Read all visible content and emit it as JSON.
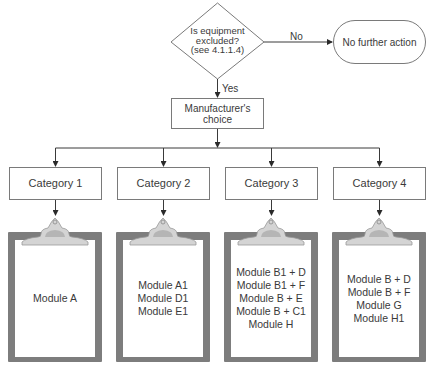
{
  "diagram": {
    "type": "flowchart",
    "decision": {
      "lines": [
        "Is equipment",
        "excluded?",
        "(see 4.1.1.4)"
      ]
    },
    "no_branch": {
      "label": "No",
      "target": "No further action"
    },
    "yes_branch": {
      "label": "Yes",
      "target": "Manufacturer's choice",
      "target_lines": [
        "Manufacturer's",
        "choice"
      ]
    },
    "categories": [
      {
        "label": "Category 1",
        "modules": [
          "Module A"
        ]
      },
      {
        "label": "Category 2",
        "modules": [
          "Module A1",
          "Module D1",
          "Module E1"
        ]
      },
      {
        "label": "Category 3",
        "modules": [
          "Module B1 + D",
          "Module B1 + F",
          "Module B + E",
          "Module B + C1",
          "Module H"
        ]
      },
      {
        "label": "Category 4",
        "modules": [
          "Module B + D",
          "Module B + F",
          "Module G",
          "Module H1"
        ]
      }
    ],
    "colors": {
      "line": "#3a3a3a",
      "box_border": "#7a7a7a",
      "clipboard_frame": "#7d7d7d",
      "clip": "#c8c8c8"
    }
  }
}
